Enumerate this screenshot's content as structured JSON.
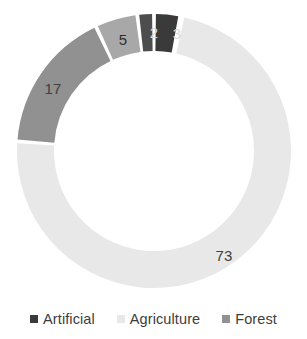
{
  "chart_data": {
    "type": "pie",
    "variant": "donut",
    "title": "",
    "xlabel": "",
    "ylabel": "",
    "categories": [
      "Agriculture",
      "Forest",
      "Agriculture",
      "Artificial",
      "Artificial"
    ],
    "values": [
      73,
      17,
      5,
      2,
      3
    ],
    "labels": [
      "73",
      "17",
      "5",
      "2",
      "3"
    ],
    "legend_position": "bottom",
    "grid": false,
    "total": 100,
    "slices": [
      {
        "label": "73",
        "value": 73,
        "series": "Agriculture",
        "color": "#e8e8e8",
        "start_angle": 12,
        "end_angle": 274,
        "label_x": 224,
        "label_y": 255
      },
      {
        "label": "17",
        "value": 17,
        "series": "Forest",
        "color": "#919191",
        "start_angle": 274,
        "end_angle": 335,
        "label_x": 53,
        "label_y": 88
      },
      {
        "label": "5",
        "value": 5,
        "series": "Agriculture",
        "color": "#a8a8a8",
        "start_angle": 335,
        "end_angle": 353,
        "label_x": 123,
        "label_y": 39
      },
      {
        "label": "2",
        "value": 2,
        "series": "Artificial",
        "color": "#4d4d4d",
        "start_angle": 353,
        "end_angle": 360,
        "label_x": 154,
        "label_y": 32
      },
      {
        "label": "3",
        "value": 3,
        "series": "Artificial",
        "color": "#3a3a3a",
        "start_angle": 360,
        "end_angle": 371,
        "label_x": 177,
        "label_y": 33
      }
    ],
    "geometry": {
      "center_x": 154,
      "center_y": 151,
      "outer_radius": 137,
      "inner_radius": 100,
      "gap_degrees": 1.6
    }
  },
  "legend": {
    "items": [
      {
        "label": "Artificial",
        "color": "#3a3a3a"
      },
      {
        "label": "Agriculture",
        "color": "#e8e8e8"
      },
      {
        "label": "Forest",
        "color": "#919191"
      }
    ]
  }
}
